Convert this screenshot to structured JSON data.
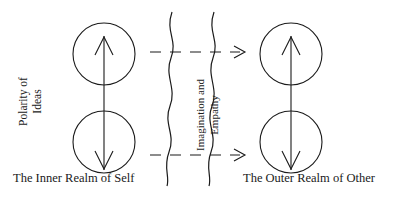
{
  "diagram": {
    "title_left_axis": {
      "line1": "Polarity of",
      "line2": "Ideas"
    },
    "boundary_label": {
      "line1": "Imagination and",
      "line2": "Empathy"
    },
    "captions": {
      "left": "The Inner Realm of Self",
      "right": "The Outer Realm of Other"
    },
    "colors": {
      "stroke": "#1a1a1a",
      "background": "#ffffff"
    },
    "nodes": [
      {
        "id": "inner-upper",
        "cx": 104,
        "cy": 54,
        "r": 31,
        "arrow": "up"
      },
      {
        "id": "inner-lower",
        "cx": 104,
        "cy": 142,
        "r": 31,
        "arrow": "down"
      },
      {
        "id": "outer-upper",
        "cx": 291,
        "cy": 54,
        "r": 31,
        "arrow": "up"
      },
      {
        "id": "outer-lower",
        "cx": 291,
        "cy": 142,
        "r": 31,
        "arrow": "down"
      }
    ],
    "connectors": [
      {
        "id": "inner-polarity-axis",
        "type": "double-headed-vertical",
        "x": 104
      },
      {
        "id": "outer-polarity-axis",
        "type": "double-headed-vertical",
        "x": 291
      },
      {
        "id": "upper-crossing",
        "type": "dashed-arrow-right",
        "y": 52
      },
      {
        "id": "lower-crossing",
        "type": "dashed-arrow-right",
        "y": 155
      }
    ],
    "boundary": {
      "type": "wavy-membrane",
      "line_count": 2
    }
  }
}
